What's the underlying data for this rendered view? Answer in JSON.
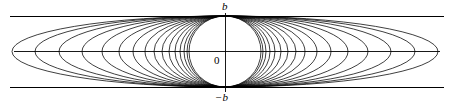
{
  "figure": {
    "width": 453,
    "height": 107,
    "background_color": "#ffffff",
    "stroke_color": "#000000",
    "labels": {
      "top": "b",
      "bottom": "−b",
      "origin": "0"
    }
  },
  "chart_data": {
    "type": "line",
    "xlabel": "",
    "ylabel": "",
    "grid": false,
    "legend": null,
    "axes": {
      "origin_px": [
        225,
        51.5
      ],
      "x_axis": {
        "y_px": 51.5,
        "x_start_px": 14,
        "x_end_px": 440,
        "label": "0",
        "visible": true
      },
      "y_axis": {
        "x_px": 225,
        "y_start_px": 13,
        "y_end_px": 92,
        "visible": true
      }
    },
    "reference_lines": [
      {
        "name": "y = b",
        "orientation": "horizontal",
        "y_px": 16,
        "x_start_px": 10,
        "x_end_px": 444,
        "label": "b"
      },
      {
        "name": "y = -b",
        "orientation": "horizontal",
        "y_px": 87,
        "x_start_px": 10,
        "x_end_px": 444,
        "label": "−b"
      }
    ],
    "b_value_px": 35.5,
    "center_px": [
      225,
      51.5
    ],
    "ellipse_count": 16,
    "semi_major_axes_px": [
      36,
      38,
      41,
      45,
      50,
      56,
      63,
      71,
      80,
      92,
      106,
      123,
      143,
      166,
      190,
      213
    ],
    "semi_minor_axis_px": 35.5
  }
}
